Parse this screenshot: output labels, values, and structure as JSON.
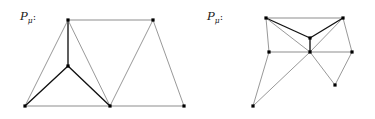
{
  "figure": {
    "background_color": "#ffffff",
    "width": 375,
    "height": 119,
    "colors": {
      "thin_edge": "#6b6b6b",
      "bold_edge": "#111111",
      "gray_edge": "#b3b3b3",
      "vertex": "#000000",
      "label_text": "#1a1a1a"
    },
    "panels": [
      {
        "id": "left",
        "name": "left-polygon-panel",
        "origin_x": 0,
        "label": {
          "base": "P",
          "subscript": "μ",
          "suffix": ":",
          "x": 20,
          "y": 20
        },
        "vertices": [
          {
            "name": "top-left-apex",
            "x": 68,
            "y": 20
          },
          {
            "name": "top-right-apex",
            "x": 153,
            "y": 20
          },
          {
            "name": "inner-middle",
            "x": 68,
            "y": 66
          },
          {
            "name": "bottom-left-corner",
            "x": 25,
            "y": 106
          },
          {
            "name": "bottom-middle",
            "x": 110,
            "y": 106
          },
          {
            "name": "bottom-right-corner",
            "x": 184,
            "y": 106
          }
        ],
        "edges": [
          {
            "from": 0,
            "to": 1,
            "style": "gray"
          },
          {
            "from": 0,
            "to": 2,
            "style": "bold"
          },
          {
            "from": 0,
            "to": 3,
            "style": "thin"
          },
          {
            "from": 0,
            "to": 4,
            "style": "thin"
          },
          {
            "from": 2,
            "to": 3,
            "style": "bold"
          },
          {
            "from": 2,
            "to": 4,
            "style": "bold"
          },
          {
            "from": 1,
            "to": 4,
            "style": "thin"
          },
          {
            "from": 1,
            "to": 5,
            "style": "thin"
          },
          {
            "from": 3,
            "to": 4,
            "style": "gray"
          },
          {
            "from": 4,
            "to": 5,
            "style": "gray"
          }
        ]
      },
      {
        "id": "right",
        "name": "right-polygon-panel",
        "origin_x": 187,
        "label": {
          "base": "P",
          "subscript": "μ",
          "suffix": ":",
          "x": 20,
          "y": 20
        },
        "vertices": [
          {
            "name": "top-left-apex",
            "x": 79,
            "y": 18
          },
          {
            "name": "top-right-apex",
            "x": 156,
            "y": 18
          },
          {
            "name": "inner-upper-middle",
            "x": 123,
            "y": 38
          },
          {
            "name": "center-crossing",
            "x": 123,
            "y": 52
          },
          {
            "name": "left-mid",
            "x": 82,
            "y": 52
          },
          {
            "name": "right-mid",
            "x": 165,
            "y": 52
          },
          {
            "name": "bottom-left-far",
            "x": 66,
            "y": 106
          },
          {
            "name": "bottom-right-low",
            "x": 148,
            "y": 85
          }
        ],
        "edges": [
          {
            "from": 0,
            "to": 1,
            "style": "gray"
          },
          {
            "from": 0,
            "to": 2,
            "style": "bold"
          },
          {
            "from": 1,
            "to": 2,
            "style": "bold"
          },
          {
            "from": 2,
            "to": 3,
            "style": "bold"
          },
          {
            "from": 0,
            "to": 3,
            "style": "thin"
          },
          {
            "from": 1,
            "to": 3,
            "style": "thin"
          },
          {
            "from": 0,
            "to": 4,
            "style": "thin"
          },
          {
            "from": 1,
            "to": 5,
            "style": "thin"
          },
          {
            "from": 4,
            "to": 3,
            "style": "gray"
          },
          {
            "from": 3,
            "to": 5,
            "style": "gray"
          },
          {
            "from": 4,
            "to": 6,
            "style": "thin"
          },
          {
            "from": 3,
            "to": 6,
            "style": "thin"
          },
          {
            "from": 3,
            "to": 7,
            "style": "thin"
          },
          {
            "from": 5,
            "to": 7,
            "style": "thin"
          }
        ]
      }
    ]
  }
}
